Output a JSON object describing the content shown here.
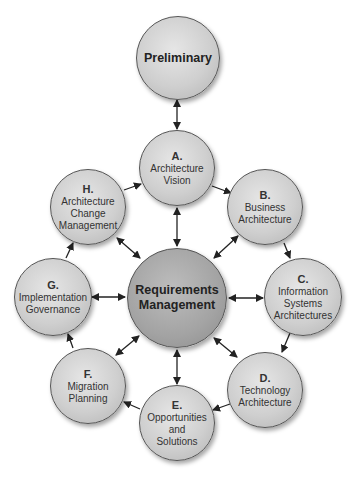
{
  "diagram": {
    "nodes": [
      {
        "id": "preliminary",
        "letter": "",
        "lines": [
          "Preliminary"
        ]
      },
      {
        "id": "a",
        "letter": "A.",
        "lines": [
          "Architecture",
          "Vision"
        ]
      },
      {
        "id": "b",
        "letter": "B.",
        "lines": [
          "Business",
          "Architecture"
        ]
      },
      {
        "id": "c",
        "letter": "C.",
        "lines": [
          "Information",
          "Systems",
          "Architectures"
        ]
      },
      {
        "id": "d",
        "letter": "D.",
        "lines": [
          "Technology",
          "Architecture"
        ]
      },
      {
        "id": "e",
        "letter": "E.",
        "lines": [
          "Opportunities",
          "and",
          "Solutions"
        ]
      },
      {
        "id": "f",
        "letter": "F.",
        "lines": [
          "Migration",
          "Planning"
        ]
      },
      {
        "id": "g",
        "letter": "G.",
        "lines": [
          "Implementation",
          "Governance"
        ]
      },
      {
        "id": "h",
        "letter": "H.",
        "lines": [
          "Architecture",
          "Change",
          "Management"
        ]
      },
      {
        "id": "requirements",
        "letter": "",
        "lines": [
          "Requirements",
          "Management"
        ]
      }
    ],
    "edges": [
      {
        "from": "preliminary",
        "to": "a",
        "type": "bidirectional"
      },
      {
        "from": "a",
        "to": "b",
        "type": "directed"
      },
      {
        "from": "b",
        "to": "c",
        "type": "directed"
      },
      {
        "from": "c",
        "to": "d",
        "type": "directed"
      },
      {
        "from": "d",
        "to": "e",
        "type": "directed"
      },
      {
        "from": "e",
        "to": "f",
        "type": "directed"
      },
      {
        "from": "f",
        "to": "g",
        "type": "directed"
      },
      {
        "from": "g",
        "to": "h",
        "type": "directed"
      },
      {
        "from": "h",
        "to": "a",
        "type": "directed"
      },
      {
        "from": "requirements",
        "to": "a",
        "type": "bidirectional"
      },
      {
        "from": "requirements",
        "to": "b",
        "type": "bidirectional"
      },
      {
        "from": "requirements",
        "to": "c",
        "type": "bidirectional"
      },
      {
        "from": "requirements",
        "to": "d",
        "type": "bidirectional"
      },
      {
        "from": "requirements",
        "to": "e",
        "type": "bidirectional"
      },
      {
        "from": "requirements",
        "to": "f",
        "type": "bidirectional"
      },
      {
        "from": "requirements",
        "to": "g",
        "type": "bidirectional"
      },
      {
        "from": "requirements",
        "to": "h",
        "type": "bidirectional"
      }
    ]
  }
}
